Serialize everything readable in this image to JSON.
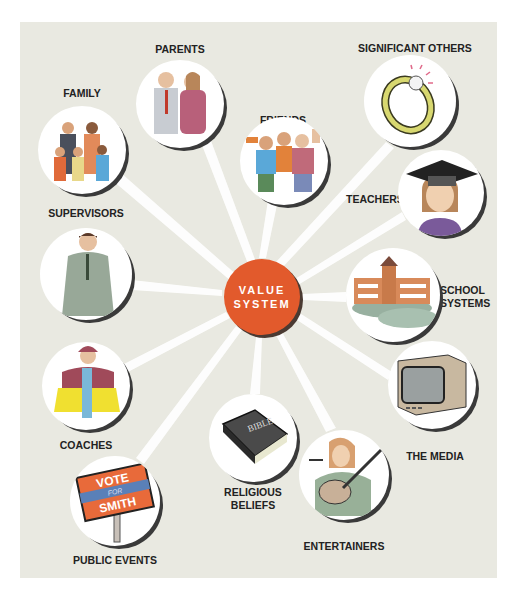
{
  "diagram": {
    "type": "hub-and-spoke",
    "center": {
      "line1": "VALUE",
      "line2": "SYSTEM",
      "color": "#e25a2c"
    },
    "background_color": "#e9e9e1",
    "arrow_color": "#ffffff",
    "nodes": [
      {
        "id": "family",
        "label": "FAMILY",
        "icon": "family-illustration"
      },
      {
        "id": "parents",
        "label": "PARENTS",
        "icon": "parents-illustration"
      },
      {
        "id": "friends",
        "label": "FRIENDS",
        "icon": "friends-illustration"
      },
      {
        "id": "significant_others",
        "label": "SIGNIFICANT OTHERS",
        "icon": "ring-illustration"
      },
      {
        "id": "teachers",
        "label": "TEACHERS",
        "icon": "graduate-illustration"
      },
      {
        "id": "supervisors",
        "label": "SUPERVISORS",
        "icon": "businessman-illustration"
      },
      {
        "id": "school_systems",
        "label_line1": "SCHOOL",
        "label_line2": "SYSTEMS",
        "icon": "school-building-illustration"
      },
      {
        "id": "coaches",
        "label": "COACHES",
        "icon": "coach-illustration"
      },
      {
        "id": "the_media",
        "label": "THE MEDIA",
        "icon": "television-illustration"
      },
      {
        "id": "religious_beliefs",
        "label_line1": "RELIGIOUS",
        "label_line2": "BELIEFS",
        "icon": "bible-illustration",
        "book_text": "BIBLE"
      },
      {
        "id": "entertainers",
        "label": "ENTERTAINERS",
        "icon": "guitar-singer-illustration"
      },
      {
        "id": "public_events",
        "label": "PUBLIC EVENTS",
        "icon": "campaign-sign-illustration",
        "sign_line1": "VOTE",
        "sign_line2": "FOR",
        "sign_line3": "SMITH"
      }
    ]
  }
}
